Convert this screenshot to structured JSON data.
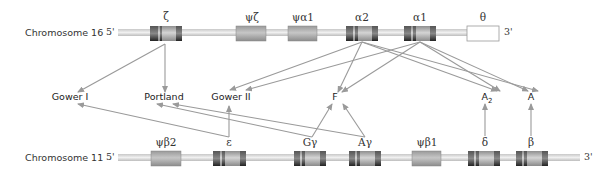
{
  "chromosomes": {
    "chr16": {
      "label": "Chromosome 16",
      "five_prime": "5'",
      "three_prime": "3'",
      "genes": [
        {
          "id": "zeta",
          "label": "ζ",
          "type": "active"
        },
        {
          "id": "psi-zeta",
          "label": "ψζ",
          "type": "pseudo"
        },
        {
          "id": "psi-alpha1",
          "label": "ψα1",
          "type": "pseudo"
        },
        {
          "id": "alpha2",
          "label": "α2",
          "type": "active"
        },
        {
          "id": "alpha1",
          "label": "α1",
          "type": "active"
        },
        {
          "id": "theta",
          "label": "θ",
          "type": "other"
        }
      ]
    },
    "chr11": {
      "label": "Chromosome 11",
      "five_prime": "5'",
      "three_prime": "3'",
      "genes": [
        {
          "id": "psi-beta2",
          "label": "ψβ2",
          "type": "pseudo"
        },
        {
          "id": "epsilon",
          "label": "ε",
          "type": "active"
        },
        {
          "id": "g-gamma",
          "label": "Gγ",
          "type": "active"
        },
        {
          "id": "a-gamma",
          "label": "Aγ",
          "type": "active"
        },
        {
          "id": "psi-beta1",
          "label": "ψβ1",
          "type": "pseudo"
        },
        {
          "id": "delta",
          "label": "δ",
          "type": "active"
        },
        {
          "id": "beta",
          "label": "β",
          "type": "active"
        }
      ]
    }
  },
  "hemoglobins": [
    {
      "id": "gower1",
      "label": "Gower I"
    },
    {
      "id": "portland",
      "label": "Portland"
    },
    {
      "id": "gower2",
      "label": "Gower II"
    },
    {
      "id": "fetal",
      "label": "F"
    },
    {
      "id": "a2",
      "label": "A",
      "sub": "2"
    },
    {
      "id": "adult",
      "label": "A"
    }
  ],
  "connections": [
    {
      "from": "zeta",
      "to": "gower1"
    },
    {
      "from": "zeta",
      "to": "portland"
    },
    {
      "from": "alpha2",
      "to": "gower2"
    },
    {
      "from": "alpha2",
      "to": "fetal"
    },
    {
      "from": "alpha2",
      "to": "a2"
    },
    {
      "from": "alpha2",
      "to": "adult"
    },
    {
      "from": "alpha1",
      "to": "gower2"
    },
    {
      "from": "alpha1",
      "to": "fetal"
    },
    {
      "from": "alpha1",
      "to": "a2"
    },
    {
      "from": "alpha1",
      "to": "adult"
    },
    {
      "from": "epsilon",
      "to": "gower1"
    },
    {
      "from": "epsilon",
      "to": "gower2"
    },
    {
      "from": "g-gamma",
      "to": "portland"
    },
    {
      "from": "g-gamma",
      "to": "fetal"
    },
    {
      "from": "a-gamma",
      "to": "portland"
    },
    {
      "from": "a-gamma",
      "to": "fetal"
    },
    {
      "from": "delta",
      "to": "a2"
    },
    {
      "from": "beta",
      "to": "adult"
    }
  ],
  "colors": {
    "arrow": "#9a9a9a",
    "chromosome_line": "#d0d0d0",
    "gene_fill": "#b8b8b8",
    "gene_band_dark": "#3a3a3a",
    "pseudo_fill": "#a8a8a8",
    "theta_fill": "#ffffff"
  }
}
